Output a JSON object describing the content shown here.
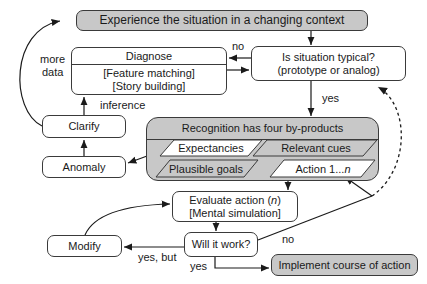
{
  "diagram": {
    "top": "Experience the situation in a changing context",
    "typical": {
      "line1": "Is situation typical?",
      "line2": "(prototype or analog)"
    },
    "diagnose": {
      "title": "Diagnose",
      "line1": "[Feature matching]",
      "line2": "[Story building]"
    },
    "clarify": "Clarify",
    "anomaly": "Anomaly",
    "recognition": {
      "title": "Recognition has four by-products",
      "items": [
        "Expectancies",
        "Relevant cues",
        "Plausible goals",
        "Action 1...",
        "n"
      ]
    },
    "evaluate": {
      "line1a": "Evaluate action (",
      "line1n": "n",
      "line1b": ")",
      "line2": "[Mental simulation]"
    },
    "will_it_work": "Will it work?",
    "modify": "Modify",
    "implement": "Implement course of action",
    "labels": {
      "no_top": "no",
      "more": "more",
      "data": "data",
      "inference": "inference",
      "yes_mid": "yes",
      "no_bottom": "no",
      "yes_but": "yes, but",
      "yes_bottom": "yes"
    },
    "colors": {
      "gray_fill": "#c8c8c8",
      "stroke": "#3a3a3a"
    }
  }
}
